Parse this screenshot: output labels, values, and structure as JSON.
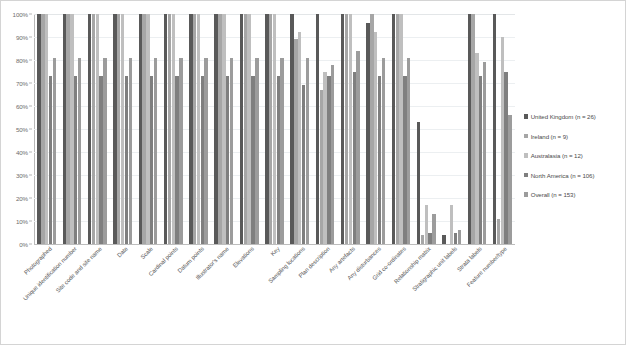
{
  "chart_data": {
    "type": "bar",
    "title": "",
    "subtitle": "",
    "xlabel": "",
    "ylabel": "",
    "ylim": [
      0,
      100
    ],
    "grid": true,
    "legend_position": "right",
    "y_ticks": [
      "0%",
      "10%",
      "20%",
      "30%",
      "40%",
      "50%",
      "60%",
      "70%",
      "80%",
      "90%",
      "100%"
    ],
    "y_tick_values": [
      0,
      10,
      20,
      30,
      40,
      50,
      60,
      70,
      80,
      90,
      100
    ],
    "categories": [
      "Photographed",
      "Unique identification number",
      "Site code and site name",
      "Date",
      "Scale",
      "Cardinal points",
      "Datum points",
      "Illustrator's name",
      "Elevations",
      "Key",
      "Sampling locations",
      "Plan description",
      "Any artefacts",
      "Any disturbances",
      "Grid co-ordinates",
      "Relationship matrix",
      "Stratigraphic unit labels",
      "Strata labels",
      "Feature number/type"
    ],
    "series": [
      {
        "name": "United Kingdom (n = 26)",
        "color": "#595959",
        "values": [
          100,
          100,
          100,
          100,
          100,
          100,
          100,
          100,
          100,
          100,
          100,
          100,
          100,
          96,
          100,
          53,
          4,
          100,
          100
        ]
      },
      {
        "name": "Ireland (n = 9)",
        "color": "#a6a6a6",
        "values": [
          100,
          100,
          100,
          100,
          100,
          100,
          100,
          100,
          100,
          100,
          89,
          67,
          100,
          100,
          100,
          4,
          0,
          100,
          11
        ]
      },
      {
        "name": "Australasia (n = 12)",
        "color": "#bfbfbf",
        "values": [
          100,
          100,
          100,
          100,
          100,
          100,
          100,
          100,
          100,
          100,
          92,
          75,
          100,
          92,
          100,
          17,
          17,
          83,
          90
        ]
      },
      {
        "name": "North America (n = 106)",
        "color": "#7f7f7f",
        "values": [
          73,
          73,
          73,
          73,
          73,
          73,
          73,
          73,
          73,
          73,
          69,
          73,
          75,
          73,
          73,
          5,
          5,
          73,
          75
        ]
      },
      {
        "name": "Overall (n = 153)",
        "color": "#9c9c9c",
        "values": [
          81,
          81,
          81,
          81,
          81,
          81,
          81,
          81,
          81,
          81,
          81,
          78,
          84,
          81,
          81,
          13,
          6,
          79,
          56
        ]
      }
    ]
  },
  "legend": {
    "items": [
      {
        "label": "United Kingdom (n = 26)",
        "color": "#595959"
      },
      {
        "label": "Ireland (n = 9)",
        "color": "#a6a6a6"
      },
      {
        "label": "Australasia (n = 12)",
        "color": "#bfbfbf"
      },
      {
        "label": "North America (n = 106)",
        "color": "#7f7f7f"
      },
      {
        "label": "Overall (n = 153)",
        "color": "#9c9c9c"
      }
    ]
  }
}
